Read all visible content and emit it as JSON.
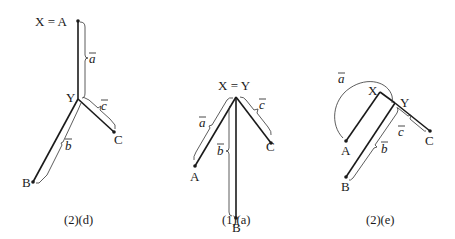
{
  "panels": [
    {
      "caption": "(2)(d)",
      "nodes": {
        "top": "X = A",
        "Y": "Y",
        "B": "B",
        "C": "C"
      },
      "segments": {
        "a": "a",
        "b": "b",
        "c": "c"
      }
    },
    {
      "caption": "(1)(a)",
      "nodes": {
        "top": "X = Y",
        "A": "A",
        "B": "B",
        "C": "C"
      },
      "segments": {
        "a": "a",
        "b": "b",
        "c": "c"
      }
    },
    {
      "caption": "(2)(e)",
      "nodes": {
        "X": "X",
        "Y": "Y",
        "A": "A",
        "B": "B",
        "C": "C"
      },
      "segments": {
        "a": "a",
        "b": "b",
        "c": "c"
      }
    }
  ]
}
